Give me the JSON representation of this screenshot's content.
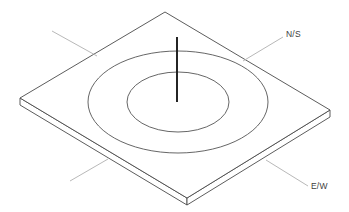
{
  "figure": {
    "kind": "isometric-technical-drawing",
    "background_color": "#ffffff",
    "line_color": "#4a4a4a",
    "ring_color": "#555555",
    "probe_color": "#1a1a1a",
    "leader_color": "#b0b0b0",
    "label_color": "#3d3d3d"
  },
  "labels": {
    "north_south": "N/S",
    "east_west": "E/W"
  },
  "geometry": {
    "canvas": {
      "width": 349,
      "height": 212
    },
    "plate_top_face": {
      "top_corner": [
        165,
        12
      ],
      "right_corner": [
        330,
        110
      ],
      "bottom_corner": [
        187,
        198
      ],
      "left_corner": [
        20,
        98
      ]
    },
    "plate_thickness": 7,
    "outer_ring": {
      "cx": 178,
      "cy": 102,
      "rx": 90,
      "ry": 51
    },
    "inner_ring": {
      "cx": 178,
      "cy": 102,
      "rx": 51,
      "ry": 30
    },
    "probe_line": {
      "x": 177,
      "y_top": 37,
      "y_bottom": 102
    },
    "leaders": [
      {
        "name": "upper-left",
        "x1": 52,
        "y1": 31,
        "x2": 97,
        "y2": 56
      },
      {
        "name": "lower-left",
        "x1": 70,
        "y1": 181,
        "x2": 108,
        "y2": 159
      },
      {
        "name": "north-south",
        "x1": 283,
        "y1": 37,
        "x2": 243,
        "y2": 61
      },
      {
        "name": "east-west",
        "x1": 308,
        "y1": 186,
        "x2": 266,
        "y2": 160
      }
    ]
  }
}
